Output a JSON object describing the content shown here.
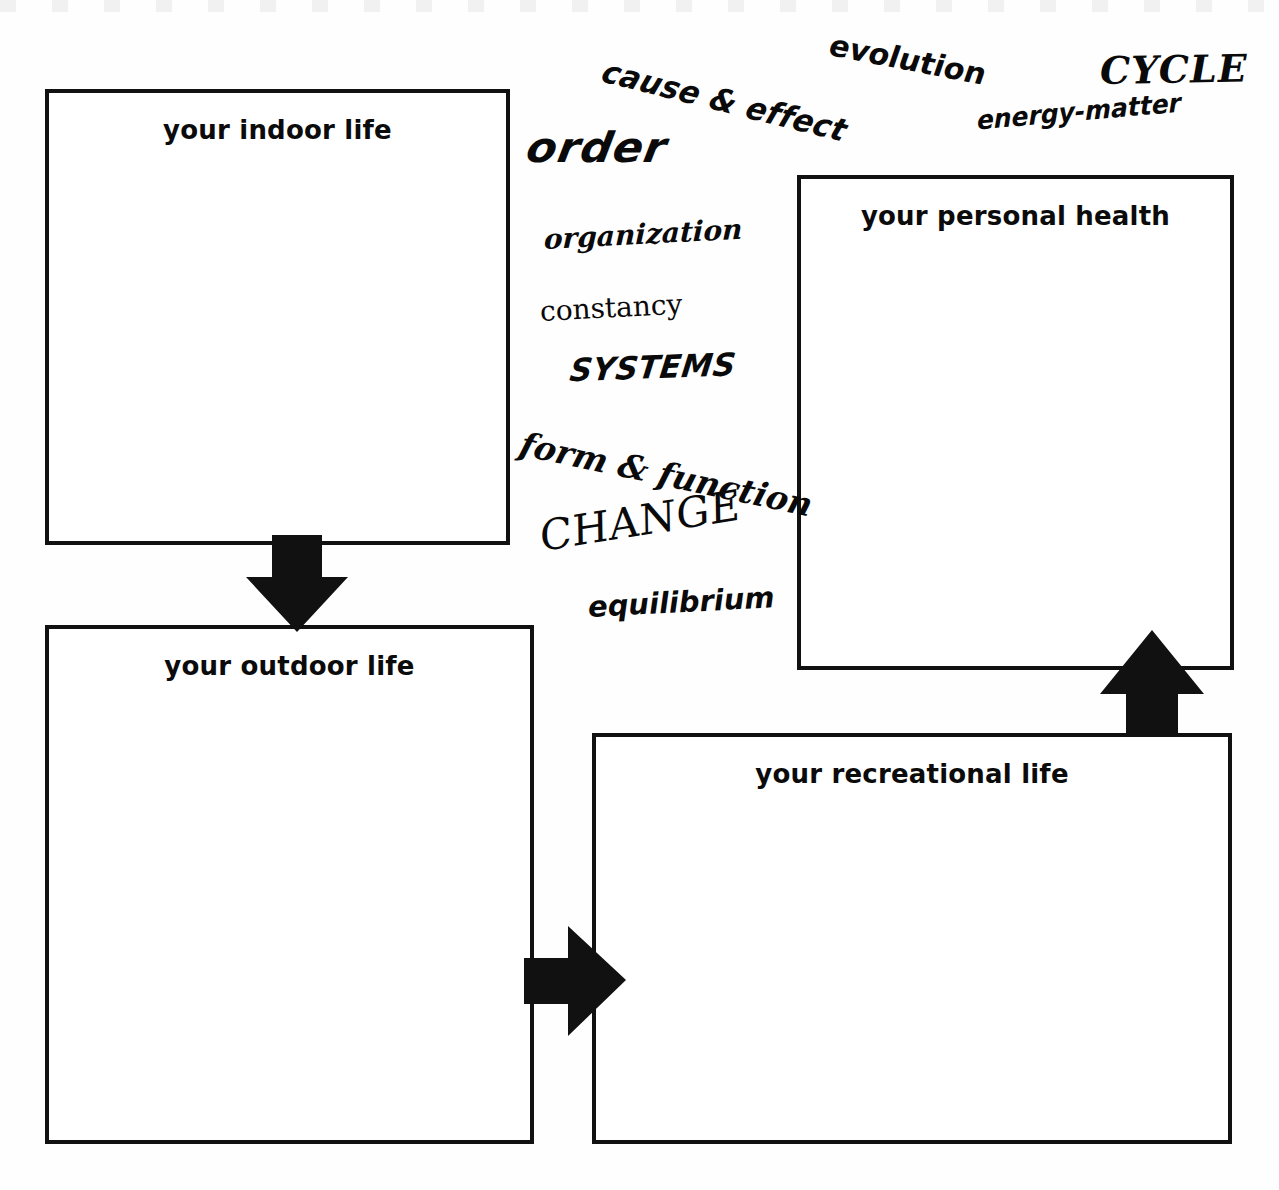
{
  "worksheet": {
    "boxes": [
      {
        "id": "indoor",
        "label": "your indoor life"
      },
      {
        "id": "health",
        "label": "your personal health"
      },
      {
        "id": "outdoor",
        "label": "your outdoor life"
      },
      {
        "id": "recreation",
        "label": "your recreational life"
      }
    ],
    "arrows": [
      {
        "id": "down",
        "direction": "down",
        "from": "your indoor life",
        "to": "your outdoor life"
      },
      {
        "id": "right",
        "direction": "right",
        "from": "your outdoor life",
        "to": "your recreational life"
      },
      {
        "id": "up",
        "direction": "up",
        "from": "your recreational life",
        "to": "your personal health"
      }
    ],
    "concept_words": [
      {
        "id": "cause",
        "text": "cause & effect"
      },
      {
        "id": "evolution",
        "text": "evolution"
      },
      {
        "id": "cycle",
        "text": "CYCLE"
      },
      {
        "id": "order",
        "text": "order"
      },
      {
        "id": "energy",
        "text": "energy-matter"
      },
      {
        "id": "organization",
        "text": "organization"
      },
      {
        "id": "constancy",
        "text": "constancy"
      },
      {
        "id": "systems",
        "text": "SYSTEMS"
      },
      {
        "id": "form",
        "text": "form & function"
      },
      {
        "id": "change",
        "text": "CHANGE"
      },
      {
        "id": "equilibrium",
        "text": "equilibrium"
      }
    ],
    "colors": {
      "ink": "#111111",
      "paper": "#ffffff",
      "arrow_fill": "#111111"
    }
  }
}
